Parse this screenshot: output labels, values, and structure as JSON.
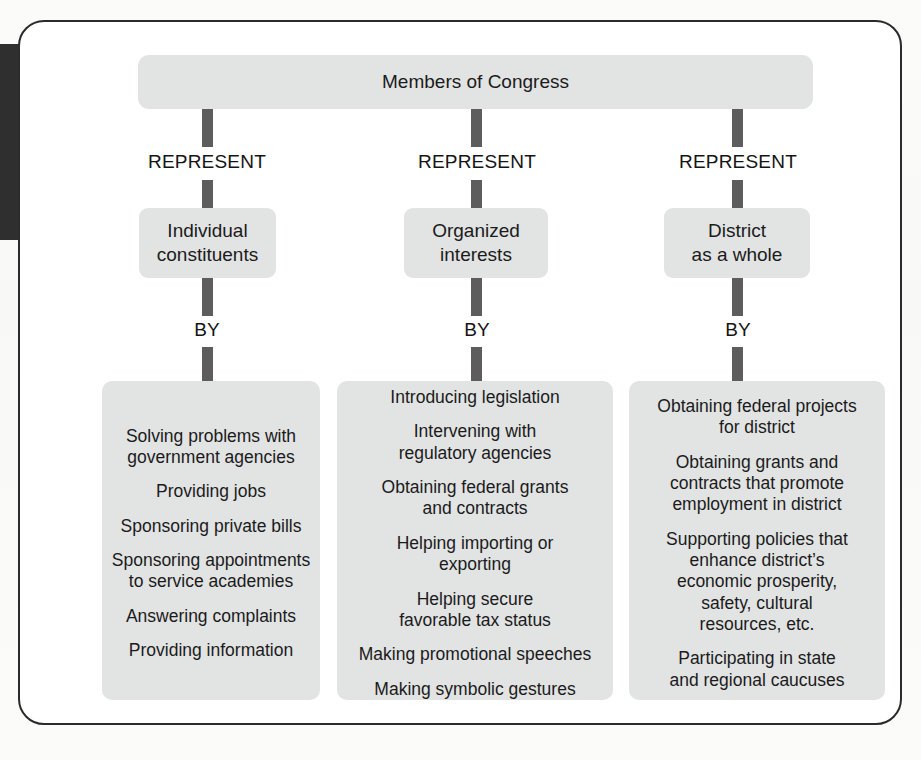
{
  "figure": {
    "page_tab_label": "C",
    "root": {
      "label": "Members of Congress"
    },
    "relation_represent": "REPRESENT",
    "relation_by": "BY",
    "colors": {
      "node_fill": "#e2e3e3",
      "connector": "#5d5d5d",
      "frame_border": "#2b2b2b",
      "text": "#1b1b1b",
      "page_tab": "#2f2f2f"
    },
    "columns": [
      {
        "id": "individual-constituents",
        "represent_label": "REPRESENT",
        "target": "Individual\nconstituents",
        "by_label": "BY",
        "activities": [
          "Solving problems with\ngovernment agencies",
          "Providing jobs",
          "Sponsoring private bills",
          "Sponsoring appointments\nto service academies",
          "Answering complaints",
          "Providing information"
        ]
      },
      {
        "id": "organized-interests",
        "represent_label": "REPRESENT",
        "target": "Organized\ninterests",
        "by_label": "BY",
        "activities": [
          "Introducing legislation",
          "Intervening with\nregulatory agencies",
          "Obtaining federal grants\nand contracts",
          "Helping importing or\nexporting",
          "Helping secure\nfavorable tax status",
          "Making promotional speeches",
          "Making symbolic gestures"
        ]
      },
      {
        "id": "district-as-a-whole",
        "represent_label": "REPRESENT",
        "target": "District\nas a whole",
        "by_label": "BY",
        "activities": [
          "Obtaining federal projects\nfor district",
          "Obtaining grants and\ncontracts that promote\nemployment in district",
          "Supporting policies that\nenhance district’s\neconomic prosperity,\nsafety, cultural\nresources, etc.",
          "Participating in state\nand regional caucuses"
        ]
      }
    ]
  }
}
